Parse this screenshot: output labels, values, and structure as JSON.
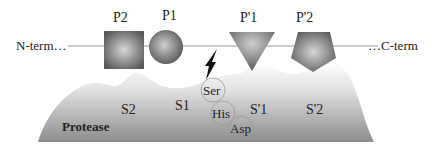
{
  "diagram": {
    "backbone": {
      "left_label": "N-term…",
      "right_label": "…C-term"
    },
    "residues": [
      {
        "id": "P2",
        "label": "P2",
        "shape": "square"
      },
      {
        "id": "P1",
        "label": "P1",
        "shape": "circle"
      },
      {
        "id": "P1prime",
        "label": "P'1",
        "shape": "triangle-down"
      },
      {
        "id": "P2prime",
        "label": "P'2",
        "shape": "pentagon"
      }
    ],
    "cleavage_icon": "lightning-bolt-icon",
    "protease": {
      "label": "Protease",
      "subsites": [
        {
          "label": "S2"
        },
        {
          "label": "S1"
        },
        {
          "label": "S'1"
        },
        {
          "label": "S'2"
        }
      ],
      "catalytic_triad": [
        {
          "label": "Ser"
        },
        {
          "label": "His"
        },
        {
          "label": "Asp"
        }
      ]
    },
    "colors": {
      "shape_dark": "#555555",
      "shape_light": "#d8d8d8",
      "protease_dark": "#8a8a8a",
      "line": "#999999"
    }
  }
}
